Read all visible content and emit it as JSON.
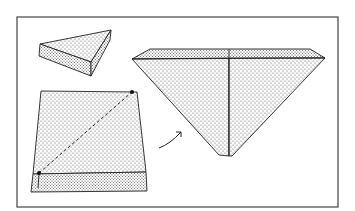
{
  "figure": {
    "colors": {
      "stroke": "#222222",
      "stipple": "#555555",
      "background": "#ffffff",
      "frame": "#444444"
    },
    "elements": [
      {
        "name": "triangular-wedge",
        "label": ""
      },
      {
        "name": "square-block-with-diagonal",
        "label": ""
      },
      {
        "name": "fold-arrow",
        "label": ""
      },
      {
        "name": "inverted-pyramid",
        "label": ""
      }
    ]
  }
}
